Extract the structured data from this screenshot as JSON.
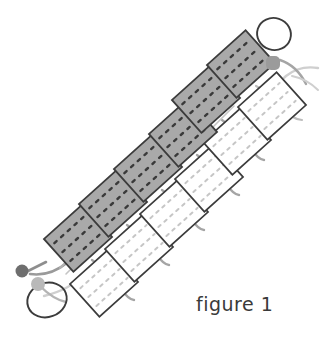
{
  "figure": {
    "caption": "figure 1",
    "title": "figure 1",
    "orientation_degrees": -42,
    "colors": {
      "background": "#ffffff",
      "panel_gray_fill": "#a9a9a9",
      "panel_gray_stroke": "#3c3c3c",
      "panel_white_fill": "#ffffff",
      "panel_white_stroke": "#3c3c3c",
      "panel_gray_dash": "#3a3a3a",
      "panel_white_dash": "#c6c6c6",
      "cable_dark": "#8e8e8e",
      "cable_light": "#c9c9c9",
      "node_dark": "#6e6e6e",
      "node_mid": "#9b9b9b",
      "node_light": "#b9b9b9",
      "loop_stroke": "#3c3c3c",
      "caption_text": "#3a3a3a"
    },
    "panel_rows": [
      {
        "name": "upper-gray-row",
        "fill": "gray",
        "count": 6,
        "panels": [
          {
            "index": 1,
            "cx": 78,
            "cy": 238,
            "w": 52,
            "h": 44,
            "rotate": -42,
            "dash_rows": 3,
            "dash_cols": 4
          },
          {
            "index": 2,
            "cx": 113,
            "cy": 203,
            "w": 52,
            "h": 44,
            "rotate": -42,
            "dash_rows": 3,
            "dash_cols": 4
          },
          {
            "index": 3,
            "cx": 148,
            "cy": 168,
            "w": 52,
            "h": 44,
            "rotate": -42,
            "dash_rows": 3,
            "dash_cols": 4
          },
          {
            "index": 4,
            "cx": 183,
            "cy": 133,
            "w": 52,
            "h": 44,
            "rotate": -42,
            "dash_rows": 3,
            "dash_cols": 4
          },
          {
            "index": 5,
            "cx": 203,
            "cy": 100,
            "w": 52,
            "h": 44,
            "rotate": -42,
            "dash_rows": 3,
            "dash_cols": 4
          },
          {
            "index": 6,
            "cx": 238,
            "cy": 65,
            "w": 52,
            "h": 44,
            "rotate": -42,
            "dash_rows": 3,
            "dash_cols": 4
          }
        ]
      },
      {
        "name": "lower-white-row",
        "fill": "white",
        "count": 6,
        "panels": [
          {
            "index": 1,
            "cx": 104,
            "cy": 283,
            "w": 52,
            "h": 44,
            "rotate": -42,
            "dash_rows": 3,
            "dash_cols": 4
          },
          {
            "index": 2,
            "cx": 139,
            "cy": 248,
            "w": 52,
            "h": 44,
            "rotate": -42,
            "dash_rows": 3,
            "dash_cols": 4
          },
          {
            "index": 3,
            "cx": 174,
            "cy": 213,
            "w": 52,
            "h": 44,
            "rotate": -42,
            "dash_rows": 3,
            "dash_cols": 4
          },
          {
            "index": 4,
            "cx": 209,
            "cy": 178,
            "w": 52,
            "h": 44,
            "rotate": -42,
            "dash_rows": 3,
            "dash_cols": 4
          },
          {
            "index": 5,
            "cx": 237,
            "cy": 141,
            "w": 52,
            "h": 44,
            "rotate": -42,
            "dash_rows": 3,
            "dash_cols": 4
          },
          {
            "index": 6,
            "cx": 272,
            "cy": 106,
            "w": 52,
            "h": 44,
            "rotate": -42,
            "dash_rows": 3,
            "dash_cols": 4
          }
        ]
      }
    ],
    "end_fittings": [
      {
        "name": "bottom-left-fitting",
        "loop_ellipse": {
          "cx": 47,
          "cy": 300,
          "rx": 20,
          "ry": 17,
          "rotate": -20
        },
        "node_dark": {
          "cx": 22,
          "cy": 271,
          "r": 6
        },
        "node_light": {
          "cx": 38,
          "cy": 284,
          "r": 6
        }
      },
      {
        "name": "top-right-fitting",
        "loop_ellipse": {
          "cx": 274,
          "cy": 34,
          "rx": 17,
          "ry": 16,
          "rotate": 18
        },
        "node_mid": {
          "cx": 273,
          "cy": 63,
          "r": 6
        }
      }
    ]
  }
}
